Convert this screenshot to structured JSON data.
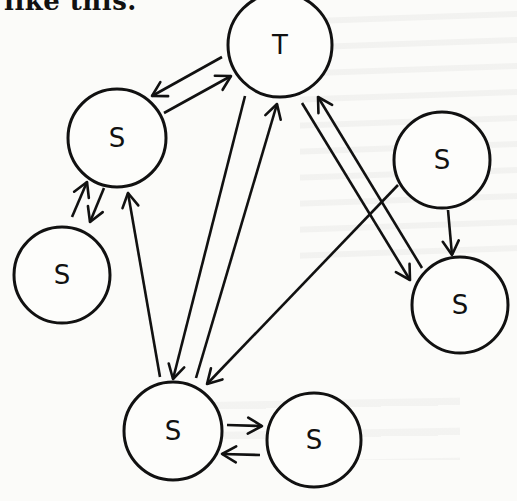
{
  "header": {
    "text": "like this."
  },
  "diagram": {
    "nodes": [
      {
        "id": "T",
        "label": "T",
        "cx": 280,
        "cy": 45,
        "r": 52
      },
      {
        "id": "S1",
        "label": "S",
        "cx": 117,
        "cy": 138,
        "r": 49
      },
      {
        "id": "S2",
        "label": "S",
        "cx": 62,
        "cy": 275,
        "r": 48
      },
      {
        "id": "S3",
        "label": "S",
        "cx": 442,
        "cy": 160,
        "r": 48
      },
      {
        "id": "S4",
        "label": "S",
        "cx": 460,
        "cy": 305,
        "r": 48
      },
      {
        "id": "S5",
        "label": "S",
        "cx": 173,
        "cy": 431,
        "r": 49
      },
      {
        "id": "S6",
        "label": "S",
        "cx": 314,
        "cy": 440,
        "r": 47
      }
    ],
    "edges": [
      {
        "from": "T",
        "to": "S1",
        "x1": 222,
        "y1": 57,
        "x2": 152,
        "y2": 96
      },
      {
        "from": "S1",
        "to": "T",
        "x1": 164,
        "y1": 113,
        "x2": 231,
        "y2": 76
      },
      {
        "from": "S2",
        "to": "S1",
        "x1": 72,
        "y1": 217,
        "x2": 87,
        "y2": 182
      },
      {
        "from": "S1",
        "to": "S2",
        "x1": 104,
        "y1": 188,
        "x2": 90,
        "y2": 222
      },
      {
        "from": "S5",
        "to": "S1",
        "x1": 160,
        "y1": 377,
        "x2": 128,
        "y2": 193
      },
      {
        "from": "T",
        "to": "S5",
        "x1": 245,
        "y1": 96,
        "x2": 173,
        "y2": 379
      },
      {
        "from": "S5",
        "to": "T",
        "x1": 196,
        "y1": 378,
        "x2": 277,
        "y2": 104
      },
      {
        "from": "T",
        "to": "S4",
        "x1": 302,
        "y1": 103,
        "x2": 410,
        "y2": 280
      },
      {
        "from": "S4",
        "to": "T",
        "x1": 422,
        "y1": 268,
        "x2": 318,
        "y2": 97
      },
      {
        "from": "S3",
        "to": "S5",
        "x1": 398,
        "y1": 185,
        "x2": 207,
        "y2": 384
      },
      {
        "from": "S3",
        "to": "S4",
        "x1": 448,
        "y1": 210,
        "x2": 452,
        "y2": 255
      },
      {
        "from": "S5",
        "to": "S6",
        "x1": 227,
        "y1": 425,
        "x2": 262,
        "y2": 426
      },
      {
        "from": "S6",
        "to": "S5",
        "x1": 260,
        "y1": 455,
        "x2": 222,
        "y2": 454
      }
    ]
  }
}
